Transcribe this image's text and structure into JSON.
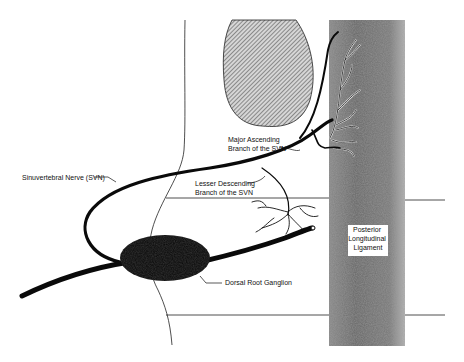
{
  "diagram": {
    "labels": {
      "major_branch": [
        "Major Ascending",
        "Branch of the SVN"
      ],
      "svn": "Sinuvertebral Nerve (SVN)",
      "lesser_branch": [
        "Lesser Descending",
        "Branch of the SVN"
      ],
      "pll": [
        "Posterior",
        "Longitudinal",
        "Ligament"
      ],
      "drg": "Dorsal Root Ganglion"
    },
    "colors": {
      "nerve": "#0a0a0a",
      "ligament": "#6e6e6e",
      "hatch": "#555555",
      "outline": "#222222"
    }
  }
}
